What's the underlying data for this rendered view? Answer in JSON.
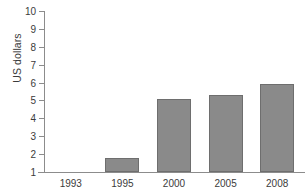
{
  "chart_data": {
    "type": "bar",
    "title": "",
    "xlabel": "",
    "ylabel": "US dollars",
    "categories": [
      "1993",
      "1995",
      "2000",
      "2005",
      "2008"
    ],
    "values": [
      1.0,
      1.8,
      5.1,
      5.3,
      5.9
    ],
    "ylim": [
      1,
      10
    ],
    "yticks": [
      "10",
      "9",
      "8",
      "7",
      "6",
      "5",
      "4",
      "3",
      "2",
      "1"
    ],
    "ytick_values": [
      10,
      9,
      8,
      7,
      6,
      5,
      4,
      3,
      2,
      1
    ],
    "grid": false,
    "legend": "none",
    "series": [
      {
        "name": "US dollars",
        "values": [
          1.0,
          1.8,
          5.1,
          5.3,
          5.9
        ]
      }
    ],
    "colors": {
      "bar_fill": "#8a8a8a",
      "bar_border": "#6e6e6e",
      "axis": "#8c8c8c",
      "text": "#3b3b3b",
      "background": "#ffffff"
    }
  }
}
